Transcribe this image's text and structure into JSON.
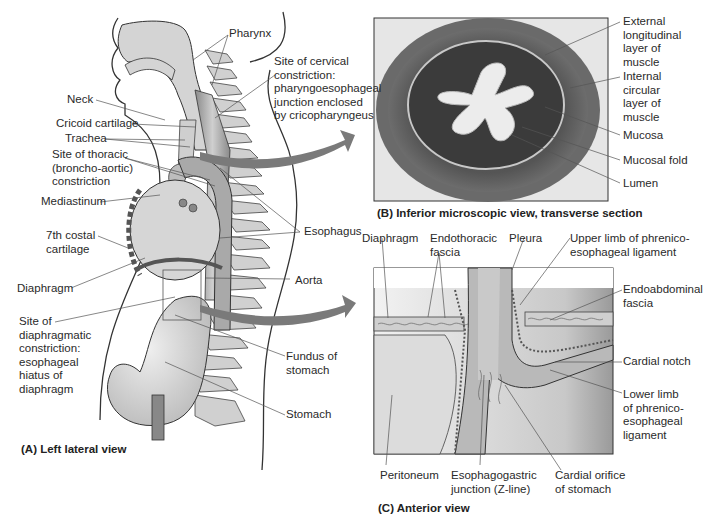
{
  "panel_a": {
    "caption": "(A) Left lateral view",
    "labels": {
      "pharynx": "Pharynx",
      "cervical_constriction": "Site of cervical\nconstriction:\npharyngoesophageal\njunction enclosed\nby cricopharyngeus",
      "neck": "Neck",
      "cricoid": "Cricoid cartilage",
      "trachea": "Trachea",
      "thoracic_constriction": "Site of thoracic\n(broncho-aortic)\nconstriction",
      "mediastinum": "Mediastinum",
      "costal": "7th costal\ncartilage",
      "esophagus": "Esophagus",
      "diaphragm": "Diaphragm",
      "aorta": "Aorta",
      "diaphragmatic_constriction": "Site of\ndiaphragmatic\nconstriction:\nesophageal\nhiatus of\ndiaphragm",
      "fundus": "Fundus of\nstomach",
      "stomach": "Stomach"
    }
  },
  "panel_b": {
    "caption": "(B) Inferior microscopic view, transverse section",
    "labels": {
      "external_muscle": "External\nlongitudinal\nlayer of\nmuscle",
      "internal_muscle": "Internal\ncircular\nlayer of\nmuscle",
      "mucosa": "Mucosa",
      "mucosal_fold": "Mucosal fold",
      "lumen": "Lumen"
    }
  },
  "panel_c": {
    "caption": "(C) Anterior view",
    "labels": {
      "diaphragm": "Diaphragm",
      "endothoracic": "Endothoracic\nfascia",
      "pleura": "Pleura",
      "upper_limb": "Upper limb of phrenico-\nesophageal ligament",
      "endoabdominal": "Endoabdominal\nfascia",
      "cardial_notch": "Cardial notch",
      "lower_limb": "Lower limb\nof phrenico-\nesophageal\nligament",
      "peritoneum": "Peritoneum",
      "ez_junction": "Esophagogastric\njunction (Z-line)",
      "cardial_orifice": "Cardial orifice\nof stomach"
    }
  },
  "colors": {
    "arrow": "#7a7a7a",
    "tissue_light": "#d9d9d9",
    "tissue_mid": "#a8a8a8",
    "tissue_dark": "#3c3c3c",
    "leader": "#555555"
  }
}
